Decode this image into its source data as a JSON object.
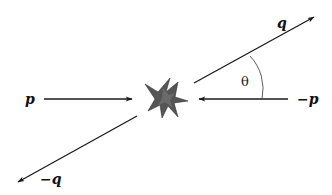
{
  "diagram": {
    "type": "scattering-collision",
    "colors": {
      "line": "#1a1a1a",
      "burst": "#555555",
      "burst_stroke": "#333333",
      "background": "#ffffff"
    },
    "labels": {
      "p": "p",
      "neg_p": "−p",
      "q": "q",
      "neg_q": "−q",
      "angle": "θ"
    },
    "vectors": [
      {
        "name": "incoming-p",
        "label": "p",
        "direction": "right"
      },
      {
        "name": "incoming-neg-p",
        "label": "−p",
        "direction": "left"
      },
      {
        "name": "outgoing-q",
        "label": "q",
        "direction": "up-right"
      },
      {
        "name": "outgoing-neg-q",
        "label": "−q",
        "direction": "down-left"
      }
    ],
    "angle_between": [
      "q",
      "−p"
    ]
  }
}
